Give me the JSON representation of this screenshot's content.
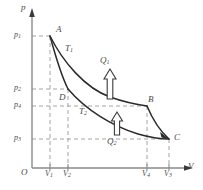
{
  "figure": {
    "type": "pressure-volume-thermodynamic-cycle",
    "axes": {
      "y_label": "p",
      "x_label": "V",
      "origin_label": "O"
    },
    "pressure_ticks": [
      {
        "id": "p1",
        "base": "p",
        "sub": "1",
        "y_px": 36
      },
      {
        "id": "p2",
        "base": "p",
        "sub": "2",
        "y_px": 89
      },
      {
        "id": "p4",
        "base": "p",
        "sub": "4",
        "y_px": 106
      },
      {
        "id": "p3",
        "base": "p",
        "sub": "3",
        "y_px": 139
      }
    ],
    "volume_ticks": [
      {
        "id": "V1",
        "base": "V",
        "sub": "1",
        "x_px": 50
      },
      {
        "id": "V2",
        "base": "V",
        "sub": "2",
        "x_px": 68
      },
      {
        "id": "V4",
        "base": "V",
        "sub": "4",
        "x_px": 147
      },
      {
        "id": "V3",
        "base": "V",
        "sub": "3",
        "x_px": 169
      }
    ],
    "points": [
      {
        "id": "A",
        "label": "A",
        "x_px": 50,
        "y_px": 36
      },
      {
        "id": "B",
        "label": "B",
        "x_px": 147,
        "y_px": 106
      },
      {
        "id": "C",
        "label": "C",
        "x_px": 169,
        "y_px": 139
      },
      {
        "id": "D",
        "label": "D",
        "x_px": 68,
        "y_px": 89
      }
    ],
    "isotherms": [
      {
        "id": "T1",
        "base": "T",
        "sub": "1",
        "label_x": 66,
        "label_y": 46
      },
      {
        "id": "T2",
        "base": "T",
        "sub": "2",
        "label_x": 80,
        "label_y": 109
      }
    ],
    "heat_arrows": [
      {
        "id": "Q1",
        "base": "Q",
        "sub": "1",
        "direction": "up",
        "label_x": 101,
        "label_y": 61,
        "arrow_x": 110,
        "arrow_y_top": 70,
        "arrow_y_bottom": 99
      },
      {
        "id": "Q2",
        "base": "Q",
        "sub": "2",
        "direction": "up",
        "label_x": 108,
        "label_y": 139,
        "arrow_x": 117,
        "arrow_y_top": 113,
        "arrow_y_bottom": 134
      }
    ],
    "colors": {
      "axis": "#8a8a8a",
      "curve": "#2b2b2b",
      "dashed": "#9a9a9a",
      "text": "#4a4a4a",
      "background": "#ffffff"
    }
  }
}
